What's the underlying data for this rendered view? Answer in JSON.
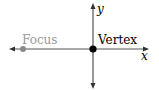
{
  "diagram": {
    "labels": {
      "focus": "Focus",
      "vertex": "Vertex",
      "x_axis": "x",
      "y_axis": "y"
    },
    "points": [
      {
        "name": "focus",
        "x": 23,
        "y": 49,
        "color": "#8a8a8a"
      },
      {
        "name": "vertex",
        "x": 93,
        "y": 49,
        "color": "#000000"
      }
    ],
    "colors": {
      "axis": "#555555",
      "focus_text": "#9a9a9a",
      "text": "#000000"
    }
  }
}
